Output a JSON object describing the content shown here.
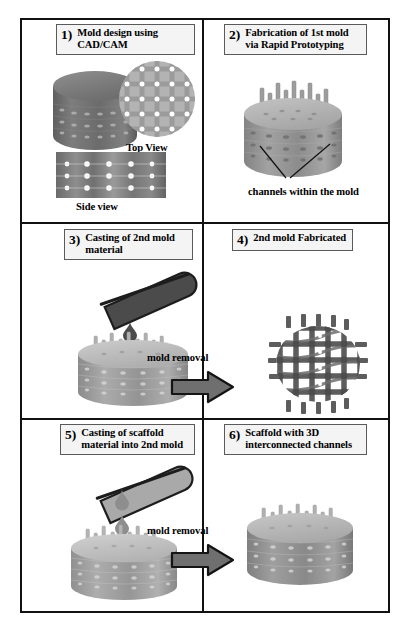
{
  "figure": {
    "title_present": false,
    "panels": [
      {
        "id": "panel-1",
        "number": "1)",
        "caption": "Mold design using CAD/CAM",
        "sub_labels": [
          "Top View",
          "Side view"
        ]
      },
      {
        "id": "panel-2",
        "number": "2)",
        "caption": "Fabrication of 1st mold via Rapid Prototyping",
        "sub_labels": [
          "channels within the mold"
        ]
      },
      {
        "id": "panel-3",
        "number": "3)",
        "caption": "Casting of 2nd mold material",
        "sub_labels": []
      },
      {
        "id": "panel-4",
        "number": "4)",
        "caption": "2nd mold Fabricated",
        "sub_labels": []
      },
      {
        "id": "panel-5",
        "number": "5)",
        "caption": "Casting of scaffold material into 2nd mold",
        "sub_labels": []
      },
      {
        "id": "panel-6",
        "number": "6)",
        "caption": "Scaffold with 3D interconnected channels",
        "sub_labels": []
      }
    ],
    "arrows": [
      {
        "id": "arrow-row2",
        "label": "mold removal"
      },
      {
        "id": "arrow-row3",
        "label": "mold removal"
      }
    ],
    "colors": {
      "frame": "#111111",
      "caption_box_fill": "#f4f4f4",
      "caption_box_border": "#5a5a5a",
      "cylinder_dark": "#6e6e6e",
      "cylinder_top_light": "#b9b9b9",
      "cylinder_mid": "#8d8d8d",
      "disc_fill": "#b0b0b0",
      "grid_line": "#8a8a8a",
      "pore_white": "#ffffff",
      "pipette_dark": "#4a4a4a",
      "pipette_light": "#a8a8a8",
      "arrow_fill": "#707070",
      "lattice_dark": "#5f5f5f"
    }
  }
}
